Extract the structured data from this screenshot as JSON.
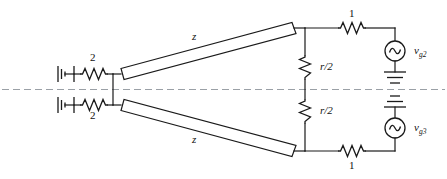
{
  "figure": {
    "type": "circuit-schematic",
    "background_color": "#ffffff",
    "line_color": "#1a1a1a",
    "symmetry_axis_color": "#9aa0a6"
  },
  "labels": {
    "source_resistor_top": "2",
    "source_resistor_bottom": "2",
    "transmission_line_top": "z",
    "transmission_line_bottom": "z",
    "load_resistor_top": "1",
    "load_resistor_bottom": "1",
    "shunt_resistor_top": "r/2",
    "shunt_resistor_bottom": "r/2",
    "generator_top": "v",
    "generator_top_sub": "g2",
    "generator_bottom": "v",
    "generator_bottom_sub": "g3"
  },
  "components": {
    "ground_left_top": "ground-icon",
    "ground_left_bottom": "ground-icon",
    "ground_center_top": "ground-icon",
    "ground_center_bottom": "ground-icon",
    "source_top": "ac-source-icon",
    "source_bottom": "ac-source-icon",
    "resistor_symbol": "zigzag-resistor-icon",
    "transmission_line_symbol": "tapered-bar-icon"
  }
}
